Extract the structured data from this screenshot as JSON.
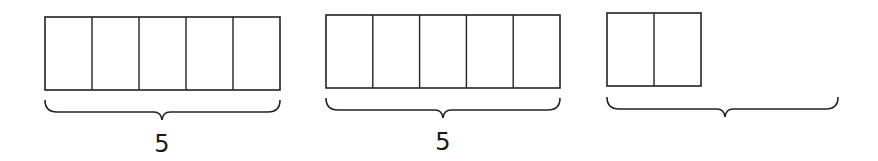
{
  "diagram": {
    "type": "tape-diagram",
    "stroke_color": "#222222",
    "groups": [
      {
        "id": "group-1",
        "cells": 5,
        "x": 45,
        "y": 17,
        "width": 235,
        "height": 73,
        "brace": {
          "x1": 45,
          "x2": 280,
          "y": 100,
          "peak_x": 162
        },
        "label": "5",
        "label_x": 162,
        "label_y": 152
      },
      {
        "id": "group-2",
        "cells": 5,
        "x": 326,
        "y": 15,
        "width": 234,
        "height": 73,
        "brace": {
          "x1": 326,
          "x2": 560,
          "y": 98,
          "peak_x": 443
        },
        "label": "5",
        "label_x": 443,
        "label_y": 150
      },
      {
        "id": "group-3",
        "cells": 2,
        "x": 607,
        "y": 13,
        "width": 94,
        "height": 73,
        "brace": {
          "x1": 607,
          "x2": 838,
          "y": 97,
          "peak_x": 725
        },
        "label": "",
        "label_x": 725,
        "label_y": 150
      }
    ]
  }
}
